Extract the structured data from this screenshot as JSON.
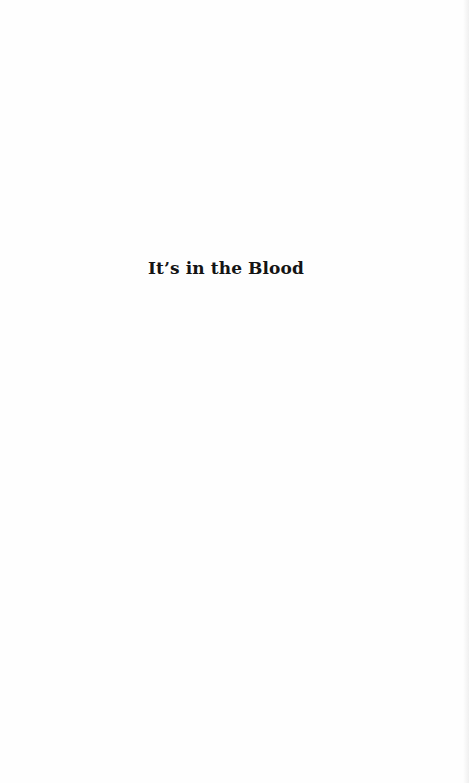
{
  "page": {
    "type": "half-title page",
    "title": "It’s in the Blood"
  }
}
